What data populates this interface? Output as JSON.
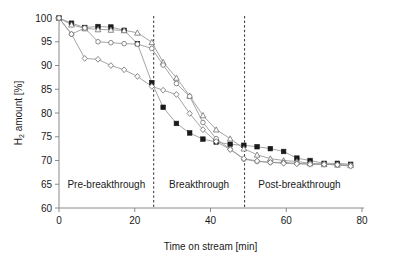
{
  "chart_data": {
    "type": "line",
    "title": "",
    "xlabel": "Time on stream [min]",
    "ylabel": "H2 amount [%]",
    "ylabel_parts": {
      "pre": "H",
      "sub": "2",
      "post": " amount [%]"
    },
    "xlim": [
      0,
      80
    ],
    "ylim": [
      60,
      100
    ],
    "xticks": [
      0,
      20,
      40,
      60,
      80
    ],
    "yticks": [
      60,
      65,
      70,
      75,
      80,
      85,
      90,
      95,
      100
    ],
    "xtick_labels": [
      "0",
      "20",
      "40",
      "60",
      "80"
    ],
    "ytick_labels": [
      "60",
      "65",
      "70",
      "75",
      "80",
      "85",
      "90",
      "95",
      "100"
    ],
    "grid": false,
    "legend": "none",
    "annotations": [
      {
        "name": "pre-breakthrough-label",
        "text": "Pre-breakthrough",
        "x": 12.5,
        "y": 65.0
      },
      {
        "name": "breakthrough-label",
        "text": "Breakthrough",
        "x": 37.0,
        "y": 65.0
      },
      {
        "name": "post-breakthrough-label",
        "text": "Post-breakthrough",
        "x": 63.5,
        "y": 65.0
      }
    ],
    "vertical_dividers": [
      {
        "name": "divider-pre-breakthrough",
        "x": 25,
        "style": "dashed"
      },
      {
        "name": "divider-post-breakthrough",
        "x": 49,
        "style": "dashed"
      }
    ],
    "series": [
      {
        "name": "series-filled-square",
        "marker": "filled-square",
        "x": [
          0.0,
          3.3,
          6.8,
          10.3,
          13.7,
          17.2,
          20.7,
          24.5,
          27.5,
          31.0,
          34.5,
          38.0,
          41.5,
          45.2,
          48.8,
          52.3,
          55.8,
          59.3,
          62.8,
          66.3,
          70.0,
          73.5,
          77.0
        ],
        "y": [
          100.0,
          98.9,
          98.0,
          98.2,
          98.1,
          97.4,
          94.6,
          86.4,
          81.2,
          77.8,
          75.8,
          74.5,
          73.9,
          73.4,
          73.2,
          72.9,
          72.5,
          71.9,
          70.5,
          70.0,
          69.4,
          69.4,
          69.2
        ]
      },
      {
        "name": "series-open-square-triangle",
        "marker": "open-square-triangle",
        "x": [
          0.0,
          3.3,
          6.8,
          10.3,
          13.7,
          17.2,
          20.7,
          24.5,
          27.5,
          31.0,
          34.5,
          38.0,
          41.5,
          45.2,
          48.8,
          52.3,
          55.8,
          59.3,
          62.8,
          66.3,
          70.0,
          73.5,
          77.0
        ],
        "y": [
          100.0,
          98.6,
          97.8,
          97.6,
          97.5,
          97.4,
          96.9,
          94.9,
          90.7,
          87.4,
          83.6,
          79.5,
          76.5,
          74.6,
          72.5,
          71.2,
          70.4,
          70.0,
          69.8,
          69.4,
          69.2,
          69.1,
          69.0
        ]
      },
      {
        "name": "series-open-circle",
        "marker": "open-circle",
        "x": [
          0.0,
          3.3,
          6.8,
          10.3,
          13.7,
          17.2,
          20.7,
          24.5,
          27.5,
          31.0,
          34.5,
          38.0,
          41.5,
          45.2,
          48.8,
          52.3,
          55.8,
          59.3,
          62.8,
          66.3,
          70.0,
          73.5,
          77.0
        ],
        "y": [
          100.0,
          96.6,
          97.9,
          95.0,
          94.8,
          94.6,
          94.5,
          93.6,
          90.1,
          86.2,
          83.5,
          78.0,
          74.6,
          72.4,
          70.3,
          69.8,
          69.6,
          69.6,
          69.4,
          69.3,
          69.2,
          69.1,
          69.0
        ]
      },
      {
        "name": "series-open-diamond",
        "marker": "open-diamond",
        "x": [
          0.0,
          3.3,
          6.8,
          10.3,
          13.7,
          17.2,
          20.7,
          24.5,
          27.5,
          31.0,
          34.5,
          38.0,
          41.5,
          45.2,
          48.8,
          52.3,
          55.8,
          59.3,
          62.8,
          66.3,
          70.0,
          73.5,
          77.0
        ],
        "y": [
          100.0,
          96.6,
          91.5,
          91.3,
          90.0,
          89.1,
          87.7,
          85.6,
          84.8,
          83.9,
          79.9,
          76.5,
          74.0,
          72.3,
          70.4,
          69.9,
          69.6,
          69.4,
          69.3,
          69.2,
          69.2,
          69.1,
          68.8
        ]
      }
    ]
  },
  "plot_geometry": {
    "left_px": 59,
    "right_px": 362,
    "top_px": 18,
    "bottom_px": 208
  }
}
